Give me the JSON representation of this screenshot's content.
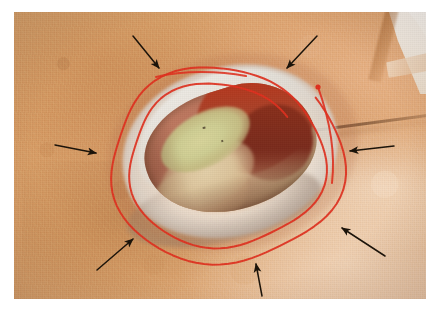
{
  "figure": {
    "kind": "clinical-photograph",
    "caption": "",
    "frame": {
      "background_color": "#ffffff",
      "photo_left": 14,
      "photo_top": 12,
      "photo_width": 412,
      "photo_height": 287
    }
  },
  "colors": {
    "page_background": "#ffffff",
    "skin_mid": "#d89c65",
    "skin_light": "#e9c2a0",
    "skin_dark": "#c6864f",
    "gauze_white": "#fdfaf6",
    "wound_rim_white": "#f3eee7",
    "granulation_red": "#b8371d",
    "granulation_deep_red": "#7a2b1c",
    "slough_yellow": "#cfce93",
    "tissue_pale": "#dbb98f",
    "marker_red": "#e0301e",
    "arrow_black": "#1a1208",
    "crease_brown": "#3e2210"
  },
  "annotations": {
    "marker": {
      "name": "red-spiral-marking",
      "color": "#e0301e",
      "stroke_width": 2.0,
      "turns": 2,
      "start_dot": {
        "x": 318,
        "y": 87,
        "radius": 2.6
      },
      "description": "two-turn red felt-tip spiral drawn on the skin encircling the wound"
    },
    "arrows": [
      {
        "id": "arrow-top-left",
        "label": "wound-margin-upper-left",
        "x1": 133,
        "y1": 36,
        "x2": 159,
        "y2": 68,
        "direction": "down-right"
      },
      {
        "id": "arrow-top-right",
        "label": "wound-margin-upper-right",
        "x1": 317,
        "y1": 36,
        "x2": 287,
        "y2": 68,
        "direction": "down-left"
      },
      {
        "id": "arrow-left",
        "label": "wound-margin-left",
        "x1": 55,
        "y1": 145,
        "x2": 96,
        "y2": 153,
        "direction": "right"
      },
      {
        "id": "arrow-right",
        "label": "wound-margin-right",
        "x1": 394,
        "y1": 146,
        "x2": 350,
        "y2": 151,
        "direction": "left"
      },
      {
        "id": "arrow-bottom-left",
        "label": "wound-margin-lower-left",
        "x1": 97,
        "y1": 270,
        "x2": 133,
        "y2": 239,
        "direction": "up-right"
      },
      {
        "id": "arrow-bottom-center",
        "label": "wound-margin-lower-centre",
        "x1": 262,
        "y1": 296,
        "x2": 256,
        "y2": 264,
        "direction": "up"
      },
      {
        "id": "arrow-bottom-right",
        "label": "wound-margin-lower-right",
        "x1": 385,
        "y1": 256,
        "x2": 342,
        "y2": 228,
        "direction": "up-left"
      }
    ]
  },
  "regions": [
    {
      "name": "periwound-skin",
      "description": "intact warm tan abdominal skin surrounding the wound"
    },
    {
      "name": "gauze-drape",
      "description": "white surgical drape/gauze at upper-right corner"
    },
    {
      "name": "skin-crease",
      "description": "dark skin fold running diagonally to the right of the wound"
    },
    {
      "name": "wound-rim",
      "description": "macerated white-grey epidermal wound edge"
    },
    {
      "name": "granulation-tissue",
      "description": "bright red granulation along the upper-right wound wall"
    },
    {
      "name": "slough",
      "description": "yellow-green fibrinous slough in the wound bed"
    },
    {
      "name": "wound-bed-pale",
      "description": "pale tan devitalised tissue at the base of the cavity"
    }
  ]
}
